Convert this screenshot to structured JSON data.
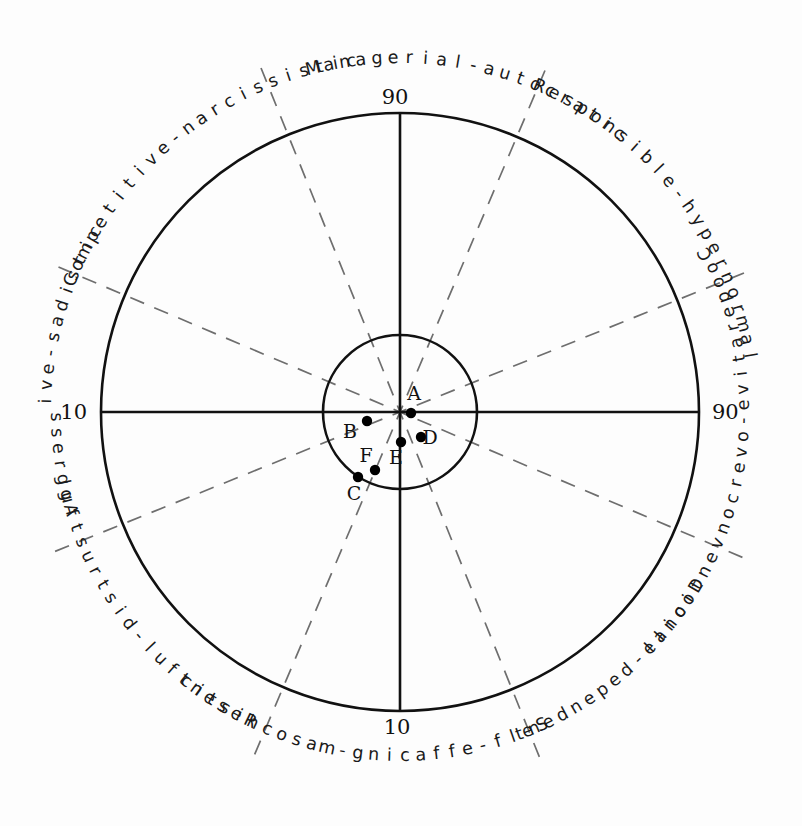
{
  "diagram": {
    "center": {
      "x": 400,
      "y": 412
    },
    "outer_radius": 299,
    "inner_radius": 77,
    "stroke_color": "#111111",
    "dashed_color": "#6e6e6e",
    "point_color": "#000000",
    "background": "#fdfdfd"
  },
  "axes": {
    "labels": {
      "top": "90",
      "right": "90",
      "bottom": "10",
      "left": "10"
    }
  },
  "octants": [
    {
      "id": "managerial-autocratic",
      "text": "Managerial-autocratic",
      "angle_deg": 78
    },
    {
      "id": "competitive-narcissistic",
      "text": "Competitive-narcissistic",
      "angle_deg": 128
    },
    {
      "id": "aggressive-sadistic",
      "text": "Aggressive-sadistic",
      "angle_deg": 173
    },
    {
      "id": "resentful-distrustful",
      "text": "Resentful-distrustful",
      "angle_deg": 218
    },
    {
      "id": "self-effacing-masochistic",
      "text": "Self-effacing-masochistic",
      "angle_deg": 263
    },
    {
      "id": "docile-dependent",
      "text": "Docile-dependent",
      "angle_deg": 310
    },
    {
      "id": "cooperative-overconventional",
      "text": "Cooperative-overconventional",
      "angle_deg": 352
    },
    {
      "id": "responsible-hypernormal",
      "text": "Responsible-hypernormal",
      "angle_deg": 38
    }
  ],
  "data_points": [
    {
      "label": "A",
      "x": 411,
      "y": 413,
      "label_x": 414,
      "label_y": 400
    },
    {
      "label": "B",
      "x": 367,
      "y": 421,
      "label_x": 350,
      "label_y": 438
    },
    {
      "label": "C",
      "x": 358,
      "y": 477,
      "label_x": 354,
      "label_y": 500
    },
    {
      "label": "D",
      "x": 421,
      "y": 437,
      "label_x": 430,
      "label_y": 444
    },
    {
      "label": "E",
      "x": 401,
      "y": 442,
      "label_x": 396,
      "label_y": 464
    },
    {
      "label": "F",
      "x": 375,
      "y": 470,
      "label_x": 366,
      "label_y": 462
    }
  ]
}
